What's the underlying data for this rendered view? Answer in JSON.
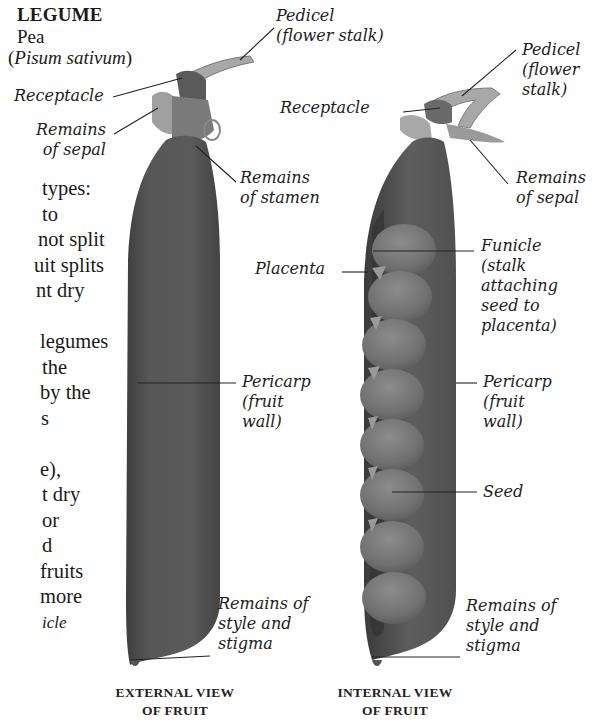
{
  "header": {
    "title": "LEGUME",
    "common_name": "Pea",
    "scientific_name_open": "(",
    "scientific_name": "Pisum sativum",
    "scientific_name_close": ")"
  },
  "body_text_fragments": [
    "types:",
    "to",
    "not split",
    "uit splits",
    "nt dry",
    "",
    "legumes",
    "the",
    "by the",
    "s",
    "",
    "e),",
    "t dry",
    "or",
    "d",
    "fruits",
    "more",
    "icle"
  ],
  "external_view": {
    "caption_line1": "EXTERNAL VIEW",
    "caption_line2": "OF FRUIT",
    "labels": {
      "pedicel": "Pedicel\n(flower stalk)",
      "receptacle": "Receptacle",
      "sepal": "Remains\nof sepal",
      "stamen": "Remains\nof stamen",
      "pericarp": "Pericarp\n(fruit\nwall)",
      "style_stigma": "Remains of\nstyle and\nstigma"
    }
  },
  "internal_view": {
    "caption_line1": "INTERNAL VIEW",
    "caption_line2": "OF FRUIT",
    "seed_count": 8,
    "labels": {
      "pedicel": "Pedicel\n(flower\nstalk)",
      "receptacle": "Receptacle",
      "sepal": "Remains\nof sepal",
      "placenta": "Placenta",
      "funicle": "Funicle\n(stalk\nattaching\nseed to\nplacenta)",
      "pericarp": "Pericarp\n(fruit\nwall)",
      "seed": "Seed",
      "style_stigma": "Remains of\nstyle and\nstigma"
    }
  },
  "colors": {
    "pod_dark": "#4a4a4a",
    "pod_mid": "#5c5c5c",
    "seed": "#7a7a7a",
    "stalk": "#9a9a9a",
    "leader_line": "#222222"
  }
}
